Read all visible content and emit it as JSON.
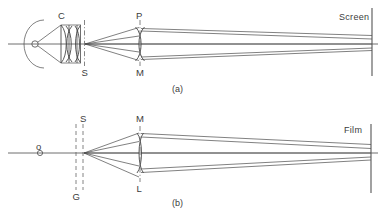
{
  "figure": {
    "kind": "optical-ray-diagram",
    "width": 389,
    "height": 217,
    "background": "#ffffff",
    "stroke_color": "#4a4a4a",
    "text_color": "#3c3c3c",
    "panels": [
      {
        "id": "a",
        "caption": "(a)",
        "description": "projector: lamp with spherical reflector, condenser C, slide plane S, projection lens P with mask M, imaging onto Screen",
        "labels": {
          "condenser": "C",
          "slide_plane": "S",
          "projection_lens": "P",
          "mask_plane": "M",
          "target": "Screen"
        }
      },
      {
        "id": "b",
        "caption": "(b)",
        "description": "camera: object point o on axis, planes G and S, camera lens L with mask plane M, imaging onto Film",
        "labels": {
          "object_point": "o",
          "plane_g": "G",
          "plane_s": "S",
          "mask_plane": "M",
          "camera_lens": "L",
          "target": "Film"
        }
      }
    ]
  },
  "text": {
    "a": {
      "C": "C",
      "S": "S",
      "P": "P",
      "M": "M",
      "screen": "Screen",
      "caption": "(a)"
    },
    "b": {
      "o": "o",
      "S": "S",
      "G": "G",
      "M": "M",
      "L": "L",
      "film": "Film",
      "caption": "(b)"
    }
  }
}
